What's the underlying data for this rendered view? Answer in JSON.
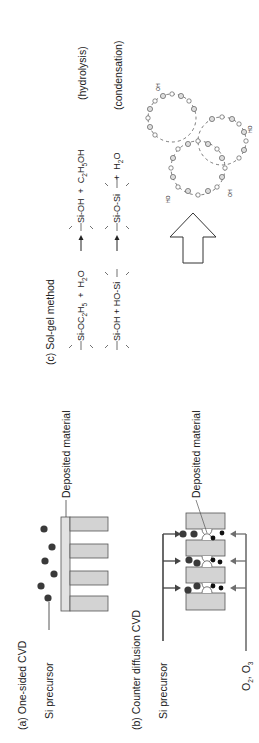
{
  "figure": {
    "panel_a": {
      "title": "(a) One-sided CVD",
      "precursor_label": "Si precursor",
      "deposited_label": "Deposited material"
    },
    "panel_b": {
      "title": "(b) Counter diffusion CVD",
      "precursor_label": "Si precursor",
      "deposited_label": "Deposited material",
      "oxidant_label": "O",
      "oxidant_sub1": "2",
      "oxidant_mid": ", O",
      "oxidant_sub2": "3"
    },
    "panel_c": {
      "title": "(c) Sol-gel method",
      "hydrolysis": {
        "reactant": "Si-OC",
        "reactant_sub1": "2",
        "reactant_mid": "H",
        "reactant_sub2": "5",
        "plus1": "+",
        "water": "H",
        "water_sub": "2",
        "water_end": "O",
        "product": "Si-OH",
        "plus2": "+",
        "ethanol": "C",
        "ethanol_sub1": "2",
        "ethanol_mid": "H",
        "ethanol_sub2": "5",
        "ethanol_end": "OH",
        "label": "(hydrolysis)"
      },
      "condensation": {
        "reactant": "Si-OH + HO-Si",
        "product": "Si-O-Si",
        "plus": "+",
        "water": "H",
        "water_sub": "2",
        "water_end": "O",
        "label": "(condensation)"
      },
      "network_atoms": {
        "si": "Si",
        "o": "O",
        "oh": "OH",
        "ho": "HO"
      }
    },
    "colors": {
      "block_fill": "#d3d3d3",
      "spine_fill": "#e2e2e2",
      "dot_dark": "#3a3a3a",
      "dot_black": "#111111",
      "line": "#444444",
      "arrow_grey": "#6e6e6e"
    }
  }
}
